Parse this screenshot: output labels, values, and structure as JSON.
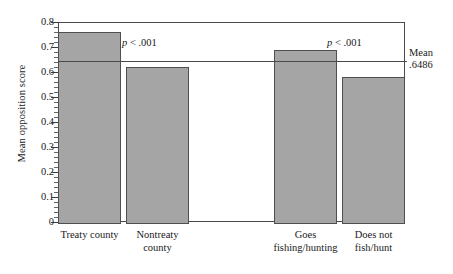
{
  "chart_data": {
    "type": "bar",
    "title": "",
    "xlabel": "",
    "ylabel": "Mean opposition score",
    "ylim": [
      0,
      0.8
    ],
    "ytick_step": 0.1,
    "yminor_step": 0.02,
    "grid": false,
    "legend": "none",
    "categories": [
      "Treaty county",
      "Nontreaty\ncounty",
      "Goes\nfishing/hunting",
      "Does not\nfish/hunt"
    ],
    "values": [
      0.765,
      0.625,
      0.693,
      0.584
    ],
    "groups": [
      {
        "name": "County type",
        "categories": [
          "Treaty county",
          "Nontreaty county"
        ],
        "values": [
          0.765,
          0.625
        ]
      },
      {
        "name": "Outdoor activity",
        "categories": [
          "Goes fishing/hunting",
          "Does not fish/hunt"
        ],
        "values": [
          0.693,
          0.584
        ]
      }
    ],
    "ytick_labels": [
      "0.8",
      "0.7",
      "0.6",
      "0.5",
      "0.4",
      "0.3",
      "0.2",
      "0.1",
      "0"
    ],
    "ytick_values": [
      0.8,
      0.7,
      0.6,
      0.5,
      0.4,
      0.3,
      0.2,
      0.1,
      0
    ],
    "reference_line": {
      "label": "Mean",
      "value_label": ".6486",
      "value": 0.6486
    },
    "annotations": [
      {
        "id": "p-group-1",
        "p_symbol": "p",
        "text": " < .001"
      },
      {
        "id": "p-group-2",
        "p_symbol": "p",
        "text": " < .001"
      }
    ],
    "colors": {
      "bar_fill": "#a5a5a5",
      "bar_stroke": "#4f4f4f",
      "axis": "#4a4a4a",
      "text": "#1a1a1a",
      "background": "#ffffff"
    }
  }
}
